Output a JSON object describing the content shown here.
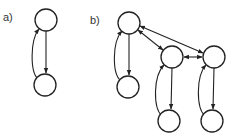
{
  "panels": [
    {
      "label": "a)",
      "nodes": [
        {
          "id": "a_top",
          "cx": 46,
          "cy": 20,
          "r": 11
        },
        {
          "id": "a_bottom",
          "cx": 45,
          "cy": 85,
          "r": 11
        }
      ],
      "edges": [
        {
          "from": "a_top",
          "to": "a_bottom",
          "type": "straight-arrow"
        },
        {
          "from": "a_bottom",
          "to": "a_top",
          "type": "curved-arrow"
        }
      ]
    },
    {
      "label": "b)",
      "nodes": [
        {
          "id": "b_top",
          "cx": 129,
          "cy": 23,
          "r": 11
        },
        {
          "id": "b_top_child",
          "cx": 128,
          "cy": 87,
          "r": 11
        },
        {
          "id": "b_mid",
          "cx": 172,
          "cy": 57,
          "r": 11
        },
        {
          "id": "b_mid_child",
          "cx": 169,
          "cy": 121,
          "r": 11
        },
        {
          "id": "b_right",
          "cx": 214,
          "cy": 57,
          "r": 11
        },
        {
          "id": "b_right_child",
          "cx": 212,
          "cy": 121,
          "r": 11
        }
      ],
      "edges": [
        {
          "from": "b_top",
          "to": "b_top_child",
          "type": "straight-arrow"
        },
        {
          "from": "b_top_child",
          "to": "b_top",
          "type": "curved-arrow"
        },
        {
          "from": "b_mid",
          "to": "b_mid_child",
          "type": "straight-arrow"
        },
        {
          "from": "b_mid_child",
          "to": "b_mid",
          "type": "curved-arrow"
        },
        {
          "from": "b_right",
          "to": "b_right_child",
          "type": "straight-arrow"
        },
        {
          "from": "b_right_child",
          "to": "b_right",
          "type": "curved-arrow"
        },
        {
          "from": "b_top",
          "to": "b_mid",
          "type": "bidirectional-arrow"
        },
        {
          "from": "b_top",
          "to": "b_right",
          "type": "bidirectional-arrow"
        },
        {
          "from": "b_mid",
          "to": "b_right",
          "type": "bidirectional-arrow"
        }
      ]
    }
  ],
  "labels": {
    "a": "a)",
    "b": "b)"
  }
}
